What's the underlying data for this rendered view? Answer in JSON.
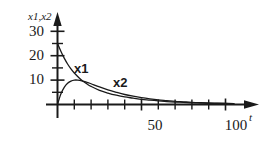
{
  "figure": {
    "background_color": "#ffffff",
    "ink_color": "#1a1a1a"
  },
  "axes": {
    "y_axis_title": "x1,x2",
    "x_axis_title": "t"
  },
  "labels": {
    "y_30": "30",
    "y_20": "20",
    "y_10": "10",
    "x_50": "50",
    "x_100": "100",
    "curve_x1": "x1",
    "curve_x2": "x2"
  },
  "chart_data": {
    "type": "line",
    "title": "",
    "subtitle": "",
    "xlabel": "t",
    "ylabel": "x1,x2",
    "xlim": [
      0,
      110
    ],
    "ylim": [
      0,
      33
    ],
    "grid": false,
    "legend": "inline-curve-labels",
    "x_ticks_major": [
      50,
      100
    ],
    "x_ticks_minor": [
      10,
      20,
      30,
      40,
      60,
      70,
      80,
      90
    ],
    "x_tick_labels": [
      "50",
      "100"
    ],
    "y_ticks_major": [
      10,
      20,
      30
    ],
    "y_ticks_minor": [
      5,
      15,
      25
    ],
    "y_tick_labels": [
      "10",
      "20",
      "30"
    ],
    "annotations": [
      {
        "text": "x1",
        "x": 16,
        "y": 15
      },
      {
        "text": "x2",
        "x": 36,
        "y": 12
      }
    ],
    "series": [
      {
        "name": "x1",
        "color": "#1a1a1a",
        "x": [
          0,
          2,
          4,
          6,
          8,
          10,
          12,
          15,
          18,
          20,
          25,
          30,
          35,
          40,
          45,
          50,
          55,
          60,
          65,
          70,
          75,
          80,
          85,
          90,
          95,
          100,
          105
        ],
        "values": [
          25.0,
          21.8,
          19.0,
          16.6,
          14.6,
          12.9,
          11.5,
          9.6,
          8.2,
          7.4,
          5.8,
          4.7,
          3.8,
          3.1,
          2.6,
          2.1,
          1.8,
          1.5,
          1.2,
          1.0,
          0.9,
          0.7,
          0.6,
          0.5,
          0.45,
          0.4,
          0.35
        ]
      },
      {
        "name": "x2",
        "color": "#1a1a1a",
        "x": [
          0,
          2,
          4,
          6,
          8,
          10,
          12,
          15,
          18,
          20,
          25,
          30,
          35,
          40,
          45,
          50,
          55,
          60,
          65,
          70,
          75,
          80,
          85,
          90,
          95,
          100,
          105
        ],
        "values": [
          0.0,
          4.3,
          7.0,
          8.7,
          9.6,
          10.0,
          10.0,
          9.6,
          9.0,
          8.5,
          7.2,
          6.0,
          5.0,
          4.1,
          3.4,
          2.8,
          2.3,
          1.9,
          1.6,
          1.3,
          1.1,
          0.9,
          0.75,
          0.62,
          0.52,
          0.43,
          0.36
        ]
      }
    ]
  }
}
